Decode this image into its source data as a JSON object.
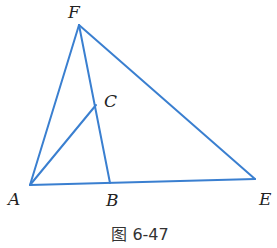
{
  "figure": {
    "caption": "图 6-47",
    "line_color": "#3a7fd0",
    "points": {
      "F": {
        "label": "F",
        "x": 79,
        "y": 25,
        "lx": 68,
        "ly": 18
      },
      "C": {
        "label": "C",
        "x": 96,
        "y": 105,
        "lx": 104,
        "ly": 107
      },
      "A": {
        "label": "A",
        "x": 30,
        "y": 185,
        "lx": 8,
        "ly": 205
      },
      "B": {
        "label": "B",
        "x": 110,
        "y": 183,
        "lx": 106,
        "ly": 206
      },
      "E": {
        "label": "E",
        "x": 255,
        "y": 179,
        "lx": 259,
        "ly": 205
      }
    },
    "segments": [
      [
        "F",
        "A"
      ],
      [
        "F",
        "E"
      ],
      [
        "F",
        "B"
      ],
      [
        "A",
        "E"
      ],
      [
        "A",
        "C"
      ]
    ]
  }
}
